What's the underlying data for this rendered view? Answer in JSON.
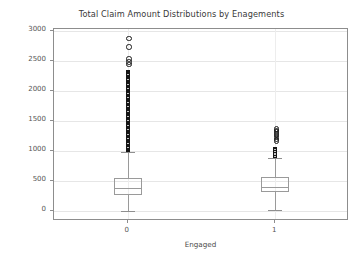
{
  "chart_data": {
    "type": "box",
    "title": "Total Claim Amount Distributions by Enagements",
    "xlabel": "Engaged",
    "ylabel": "Total Claim Amount",
    "categories": [
      "0",
      "1"
    ],
    "xtick_labels": [
      "0",
      "1"
    ],
    "ytick_labels": [
      "0",
      "500",
      "1000",
      "1500",
      "2000",
      "2500",
      "3000"
    ],
    "ytick_values": [
      0,
      500,
      1000,
      1500,
      2000,
      2500,
      3000
    ],
    "ylim": [
      -170,
      3030
    ],
    "grid": true,
    "legend": "none",
    "boxes": [
      {
        "category": "0",
        "whisker_low": 0,
        "q1": 270,
        "median": 385,
        "q3": 550,
        "whisker_high": 975,
        "outlier_min": 980,
        "outlier_max": 2890,
        "outlier_count_approx": 420,
        "notable_outliers": [
          2890,
          2750,
          2550,
          2500,
          2455,
          2350,
          2300,
          2260,
          2200,
          2130,
          2060,
          1990,
          1930,
          1870,
          1800,
          1740,
          1680,
          1620,
          1560,
          1500,
          1440,
          1380,
          1320,
          1260,
          1200,
          1140,
          1080,
          1020,
          990
        ]
      },
      {
        "category": "1",
        "whisker_low": 20,
        "q1": 320,
        "median": 400,
        "q3": 570,
        "whisker_high": 875,
        "outlier_min": 880,
        "outlier_max": 1380,
        "outlier_count_approx": 60,
        "notable_outliers": [
          1380,
          1355,
          1330,
          1300,
          1270,
          1240,
          1210,
          1180,
          1060,
          1040,
          1010,
          985,
          960,
          935,
          910,
          885
        ]
      }
    ]
  },
  "axes": {
    "title": "Total Claim Amount Distributions by Enagements",
    "ylabel": "Total Claim Amount",
    "xlabel": "Engaged"
  },
  "colors": {
    "background": "#ffffff",
    "spine": "#8d8d8d",
    "grid": "#e6e6e6",
    "box_edge": "#9a9a9a",
    "flier_edge": "#1a1a1a",
    "text": "#555555"
  }
}
